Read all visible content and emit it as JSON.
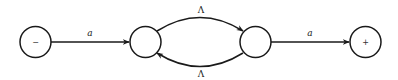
{
  "diagram": {
    "type": "finite-automaton",
    "nodes": [
      {
        "id": "q0",
        "label": "−",
        "role": "start"
      },
      {
        "id": "q1",
        "label": ""
      },
      {
        "id": "q2",
        "label": ""
      },
      {
        "id": "q3",
        "label": "+",
        "role": "final"
      }
    ],
    "edges": [
      {
        "from": "q0",
        "to": "q1",
        "label": "a"
      },
      {
        "from": "q1",
        "to": "q2",
        "label": "Λ"
      },
      {
        "from": "q2",
        "to": "q1",
        "label": "Λ"
      },
      {
        "from": "q2",
        "to": "q3",
        "label": "a"
      }
    ]
  }
}
